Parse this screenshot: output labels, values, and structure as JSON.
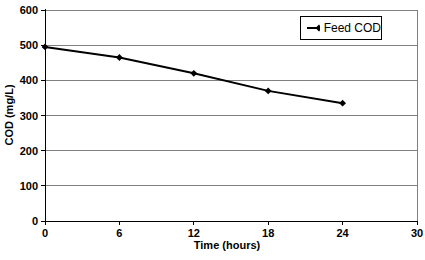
{
  "chart_data": {
    "type": "line",
    "title": "",
    "xlabel": "Time (hours)",
    "ylabel": "COD (mg/L)",
    "xlim": [
      0,
      30
    ],
    "ylim": [
      0,
      600
    ],
    "xticks": [
      0,
      6,
      12,
      18,
      24,
      30
    ],
    "yticks": [
      0,
      100,
      200,
      300,
      400,
      500,
      600
    ],
    "grid": "horizontal",
    "legend_position": "top-right-inside",
    "series": [
      {
        "name": "Feed COD",
        "x": [
          0,
          6,
          12,
          18,
          24
        ],
        "values": [
          495,
          465,
          420,
          370,
          335
        ],
        "color": "#000000",
        "marker": "diamond"
      }
    ],
    "colors": {
      "gridline": "#808080",
      "plot_border": "#808080",
      "axis": "#000000",
      "background": "#ffffff"
    }
  }
}
